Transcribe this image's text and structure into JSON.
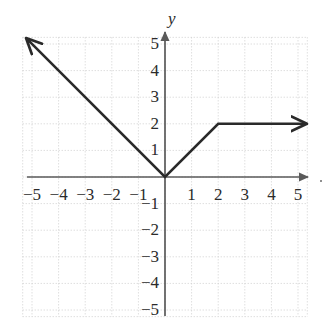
{
  "chart_data": {
    "type": "line",
    "title": "",
    "xlabel": "",
    "ylabel": "y",
    "axis_label_y": "y",
    "xlim": [
      -5.35,
      5.35
    ],
    "ylim": [
      -5.25,
      5.25
    ],
    "grid": true,
    "grid_style": "dotted",
    "grid_step": 1,
    "x_ticks": [
      -5,
      -4,
      -3,
      -2,
      -1,
      1,
      2,
      3,
      4,
      5
    ],
    "y_ticks": [
      5,
      4,
      3,
      2,
      1,
      -1,
      -2,
      -3,
      -4,
      -5
    ],
    "x_tick_labels": [
      "−5",
      "−4",
      "−3",
      "−2",
      "−1",
      "1",
      "2",
      "3",
      "4",
      "5"
    ],
    "y_tick_labels": [
      "5",
      "4",
      "3",
      "2",
      "1",
      "−1",
      "−2",
      "−3",
      "−4",
      "−5"
    ],
    "series": [
      {
        "name": "piecewise-function",
        "points": [
          [
            -5.2,
            5.2
          ],
          [
            0,
            0
          ],
          [
            2,
            2
          ],
          [
            5.3,
            2
          ]
        ],
        "arrow_start": true,
        "arrow_end": true,
        "color": "#2a2a2a",
        "width": 2.6
      }
    ],
    "axis_arrows": {
      "x_positive": true,
      "x_negative": false,
      "y_positive": true,
      "y_negative": false
    },
    "colors": {
      "grid": "#cfcfcf",
      "axis": "#5a5a5a",
      "curve": "#2a2a2a",
      "text": "#2b2b2b",
      "background": "#ffffff"
    }
  }
}
